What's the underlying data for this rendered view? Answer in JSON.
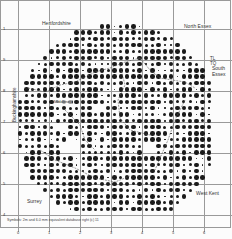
{
  "map": {
    "type": "dot distribution grid map",
    "labels": {
      "hertfordshire": "Hertfordshire",
      "north_essex": "North Essex",
      "south_essex_1": "South",
      "south_essex_2": "Essex",
      "west_kent": "West Kent",
      "surrey": "Surrey",
      "buckinghamshire": "Buckinghamshire",
      "grid_tl": "TL",
      "grid_tq": "TQ",
      "middlesex": "Middlesex"
    },
    "x_ticks": [
      "0",
      "1",
      "2",
      "3",
      "4",
      "5",
      "6"
    ],
    "y_ticks": [
      "1",
      "9",
      "8",
      "7",
      "6",
      "5",
      "4"
    ],
    "caption": "Symbols: 2m and 6.0 mm equivalent database right (c) 11",
    "colors": {
      "dot": "#1a1a1a",
      "grid": "#9a9a9a",
      "background": "#fcfcfc"
    }
  }
}
